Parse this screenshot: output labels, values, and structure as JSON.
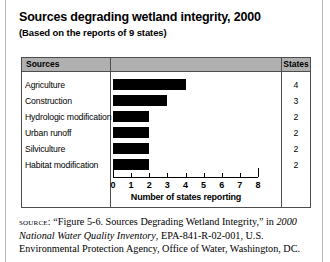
{
  "title": "Sources degrading wetland integrity, 2000",
  "subtitle": "(Based on the reports of 9 states)",
  "table": {
    "headers": {
      "sources": "Sources",
      "chart": "",
      "states": "States"
    }
  },
  "chart_data": {
    "type": "bar",
    "orientation": "horizontal",
    "title": "Sources degrading wetland integrity, 2000",
    "subtitle": "(Based on the reports of 9 states)",
    "categories": [
      "Agriculture",
      "Construction",
      "Hydrologic modification",
      "Urban runoff",
      "Silviculture",
      "Habitat modification"
    ],
    "values": [
      4,
      3,
      2,
      2,
      2,
      2
    ],
    "xlabel": "Number of states reporting",
    "ylabel": "",
    "xlim": [
      0,
      8
    ],
    "xticks": [
      0,
      1,
      2,
      3,
      4,
      5,
      6,
      7,
      8
    ],
    "xtick_labels": [
      "0",
      "1",
      "2",
      "3",
      "4",
      "5",
      "6",
      "7",
      "8"
    ],
    "grid": false,
    "legend": "none",
    "bar_color": "#000000"
  },
  "source": {
    "label": "source:",
    "part1": " “Figure 5-6. Sources Degrading Wetland Integrity,” in ",
    "italic1": "2000 National Water Quality Inventory",
    "part2": ", EPA-841-R-02-001, U.S. Environmental Protection Agency, Office of Water, Washington, DC."
  }
}
